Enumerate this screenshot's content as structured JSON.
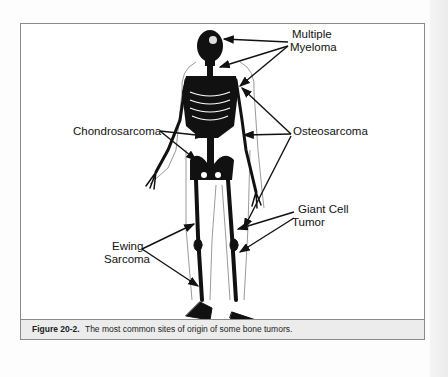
{
  "figure": {
    "caption_label": "Figure 20-2.",
    "caption_text": "The most common sites of origin of some bone tumors.",
    "labels": {
      "multiple_myeloma_1": "Multiple",
      "multiple_myeloma_2": "Myeloma",
      "chondrosarcoma": "Chondrosarcoma",
      "osteosarcoma": "Osteosarcoma",
      "giant_cell_1": "Giant Cell",
      "giant_cell_2": "Tumor",
      "ewing_1": "Ewing",
      "ewing_2": "Sarcoma"
    },
    "colors": {
      "frame_border": "#8a8a8a",
      "caption_bg": "#ececec",
      "ink": "#111111"
    }
  }
}
